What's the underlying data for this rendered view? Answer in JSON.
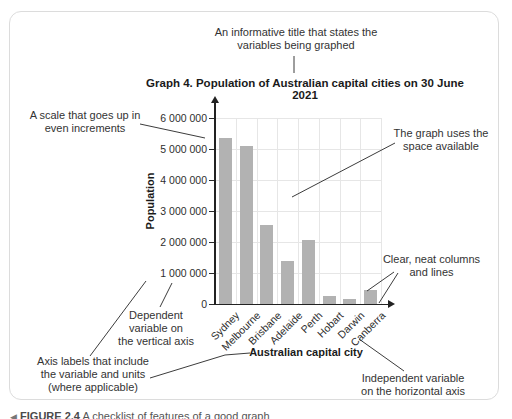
{
  "annotations": {
    "title_note": [
      "An informative title that states the",
      "variables being graphed"
    ],
    "scale_note": [
      "A scale that goes up in",
      "even increments"
    ],
    "space_note": [
      "The graph uses the",
      "space available"
    ],
    "columns_note": [
      "Clear, neat columns",
      "and lines"
    ],
    "dependent_note": [
      "Dependent",
      "variable on",
      "the vertical axis"
    ],
    "axis_labels_note": [
      "Axis labels that include",
      "the variable and units",
      "(where applicable)"
    ],
    "independent_note": [
      "Independent variable",
      "on the horizontal axis"
    ]
  },
  "chart_data": {
    "type": "bar",
    "title": "Graph 4. Population of Australian capital cities on 30 June 2021",
    "categories": [
      "Sydney",
      "Melbourne",
      "Brisbane",
      "Adelaide",
      "Perth",
      "Hobart",
      "Darwin",
      "Canberra"
    ],
    "values": [
      5350000,
      5100000,
      2550000,
      1380000,
      2080000,
      250000,
      150000,
      440000
    ],
    "xlabel": "Australian capital city",
    "ylabel": "Population",
    "ylim": [
      0,
      6000000
    ],
    "ytick_step": 1000000,
    "ytick_labels": [
      "0",
      "1 000 000",
      "2 000 000",
      "3 000 000",
      "4 000 000",
      "5 000 000",
      "6 000 000"
    ],
    "grid": "full",
    "legend": "none",
    "bar_color": "#b2b2b2"
  },
  "caption": {
    "marker": "◀",
    "label": "FIGURE 2.4",
    "text": "A checklist of features of a good graph"
  }
}
